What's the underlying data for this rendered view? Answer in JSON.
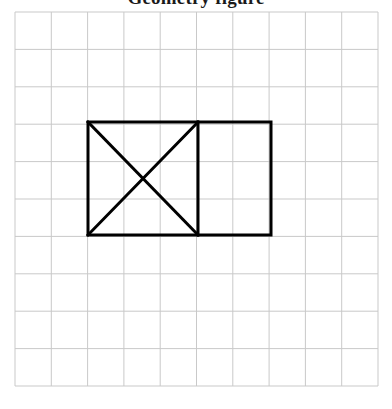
{
  "page": {
    "width": 392,
    "height": 409,
    "background_color": "#ffffff",
    "title_fragment_text": "Geometry figure"
  },
  "grid": {
    "columns": 10,
    "rows": 10,
    "origin_x": 15,
    "origin_y": 12,
    "cell_width": 36.3,
    "cell_height": 37.4,
    "line_color": "#c9c9c9",
    "line_width": 1,
    "visible": true
  },
  "figure": {
    "stroke_color": "#000000",
    "stroke_width": 3,
    "fill": "none",
    "name": "rectangle-with-diagonals",
    "bounds": {
      "left": 88,
      "top": 122,
      "right": 271,
      "bottom": 235,
      "width": 183,
      "height": 113
    },
    "shapes": [
      {
        "name": "outer-rectangle",
        "type": "rect",
        "x": 88,
        "y": 122,
        "width": 183,
        "height": 113
      },
      {
        "name": "vertical-divider",
        "type": "line",
        "x1": 198,
        "y1": 122,
        "x2": 198,
        "y2": 235
      },
      {
        "name": "diagonal-top-left-to-bottom-right",
        "type": "line",
        "x1": 88,
        "y1": 122,
        "x2": 198,
        "y2": 235
      },
      {
        "name": "diagonal-bottom-left-to-top-right",
        "type": "line",
        "x1": 88,
        "y1": 235,
        "x2": 198,
        "y2": 122
      }
    ],
    "cross_center": {
      "x": 143,
      "y": 178.5
    }
  }
}
